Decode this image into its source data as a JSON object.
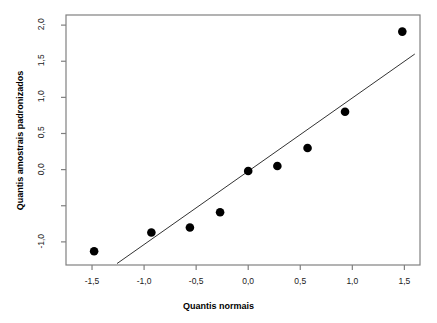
{
  "chart_data": {
    "type": "scatter",
    "title": "",
    "subtitle": "",
    "xlabel": "Quantis normais",
    "ylabel": "Quantis amostrais padronizados",
    "xlim": [
      -1.75,
      1.65
    ],
    "ylim": [
      -1.32,
      2.14
    ],
    "grid": false,
    "legend": "none",
    "x_ticks": [
      {
        "value": -1.5,
        "label": "-1,5"
      },
      {
        "value": -1.0,
        "label": "-1,0"
      },
      {
        "value": -0.5,
        "label": "-0,5"
      },
      {
        "value": 0.0,
        "label": "0,0"
      },
      {
        "value": 0.5,
        "label": "0,5"
      },
      {
        "value": 1.0,
        "label": "1,0"
      },
      {
        "value": 1.5,
        "label": "1,5"
      }
    ],
    "y_ticks": [
      {
        "value": 2.0,
        "label": "2,0"
      },
      {
        "value": 1.5,
        "label": "1,5"
      },
      {
        "value": 1.0,
        "label": "1,0"
      },
      {
        "value": 0.5,
        "label": "0,5"
      },
      {
        "value": 0.0,
        "label": "0,0"
      },
      {
        "value": -0.5,
        "label": ""
      },
      {
        "value": -1.0,
        "label": "-1,0"
      }
    ],
    "series": [
      {
        "name": "Quantis amostrais",
        "type": "scatter",
        "marker": "filled-circle",
        "color": "#000000",
        "points": [
          {
            "x": -1.48,
            "y": -1.13
          },
          {
            "x": -0.93,
            "y": -0.87
          },
          {
            "x": -0.56,
            "y": -0.8
          },
          {
            "x": -0.27,
            "y": -0.59
          },
          {
            "x": 0.0,
            "y": -0.02
          },
          {
            "x": 0.28,
            "y": 0.05
          },
          {
            "x": 0.57,
            "y": 0.3
          },
          {
            "x": 0.93,
            "y": 0.8
          },
          {
            "x": 1.48,
            "y": 1.91
          }
        ]
      },
      {
        "name": "Linha de referencia",
        "type": "line",
        "color": "#333333",
        "x_start": -1.26,
        "y_start": -1.3,
        "x_end": 1.6,
        "y_end": 1.6
      }
    ]
  },
  "axis": {
    "x_title": "Quantis normais",
    "y_title": "Quantis amostrais padronizados"
  }
}
